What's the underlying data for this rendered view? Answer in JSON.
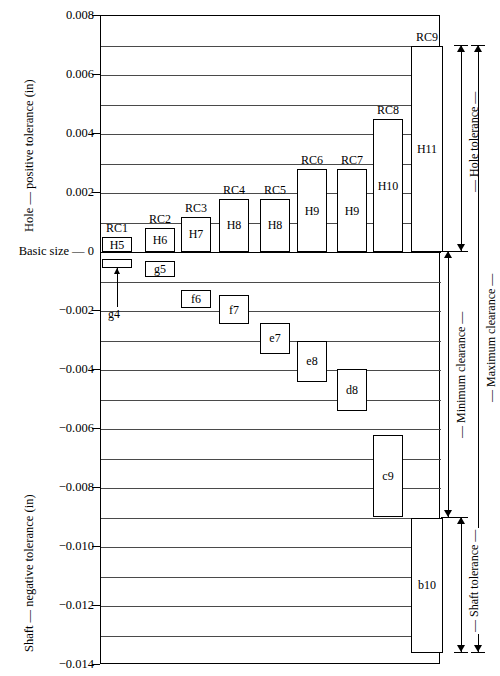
{
  "chart_data": {
    "type": "bar",
    "title": "",
    "subtitle": "",
    "ylabel_top": "Hole — positive tolerance (in)",
    "ylabel_bottom": "Shaft — negative tolerance (in)",
    "zero_label": "Basic size — 0",
    "xlabel": "",
    "units": "in",
    "ylim": [
      -0.014,
      0.008
    ],
    "grid": true,
    "grid_step": 0.001,
    "legend": "none",
    "yticks": [
      "0.008",
      "0.006",
      "0.004",
      "0.002",
      "-0.002",
      "-0.004",
      "-0.006",
      "-0.008",
      "-0.010",
      "-0.012",
      "-0.014"
    ],
    "ytick_values": [
      0.008,
      0.006,
      0.004,
      0.002,
      -0.002,
      -0.004,
      -0.006,
      -0.008,
      -0.01,
      -0.012,
      -0.014
    ],
    "categories": [
      "RC1",
      "RC2",
      "RC3",
      "RC4",
      "RC5",
      "RC6",
      "RC7",
      "RC8",
      "RC9"
    ],
    "hole_series": {
      "name": "Hole tolerance",
      "items": [
        {
          "fit": "RC1",
          "grade": "H5",
          "low": 0.0,
          "high": 0.0005
        },
        {
          "fit": "RC2",
          "grade": "H6",
          "low": 0.0,
          "high": 0.0008
        },
        {
          "fit": "RC3",
          "grade": "H7",
          "low": 0.0,
          "high": 0.0012
        },
        {
          "fit": "RC4",
          "grade": "H8",
          "low": 0.0,
          "high": 0.0018
        },
        {
          "fit": "RC5",
          "grade": "H8",
          "low": 0.0,
          "high": 0.0018
        },
        {
          "fit": "RC6",
          "grade": "H9",
          "low": 0.0,
          "high": 0.0028
        },
        {
          "fit": "RC7",
          "grade": "H9",
          "low": 0.0,
          "high": 0.0028
        },
        {
          "fit": "RC8",
          "grade": "H10",
          "low": 0.0,
          "high": 0.0045
        },
        {
          "fit": "RC9",
          "grade": "H11",
          "low": 0.0,
          "high": 0.007
        }
      ]
    },
    "shaft_series": {
      "name": "Shaft tolerance",
      "items": [
        {
          "fit": "RC1",
          "grade": "g4",
          "low": -0.00055,
          "high": -0.00025
        },
        {
          "fit": "RC2",
          "grade": "g5",
          "low": -0.00085,
          "high": -0.0003
        },
        {
          "fit": "RC3",
          "grade": "f6",
          "low": -0.0019,
          "high": -0.0013
        },
        {
          "fit": "RC4",
          "grade": "f7",
          "low": -0.00245,
          "high": -0.00145
        },
        {
          "fit": "RC5",
          "grade": "e7",
          "low": -0.00345,
          "high": -0.0024
        },
        {
          "fit": "RC6",
          "grade": "e8",
          "low": -0.0044,
          "high": -0.003
        },
        {
          "fit": "RC7",
          "grade": "d8",
          "low": -0.0054,
          "high": -0.00395
        },
        {
          "fit": "RC8",
          "grade": "c9",
          "low": -0.009,
          "high": -0.0062
        },
        {
          "fit": "RC9",
          "grade": "b10",
          "low": -0.0136,
          "high": -0.009
        }
      ]
    },
    "annotations": [
      {
        "name": "hole-tolerance",
        "label": "Hole tolerance",
        "from": 0.007,
        "to": 0.0
      },
      {
        "name": "minimum-clearance",
        "label": "Minimum clearance",
        "from": 0.0,
        "to": -0.009
      },
      {
        "name": "maximum-clearance",
        "label": "Maximum clearance",
        "from": 0.007,
        "to": -0.0136
      },
      {
        "name": "shaft-tolerance",
        "label": "Shaft tolerance",
        "from": -0.009,
        "to": -0.0136
      }
    ],
    "callouts": [
      {
        "name": "g4-callout",
        "label": "g4",
        "target_fit": "RC1"
      }
    ]
  }
}
